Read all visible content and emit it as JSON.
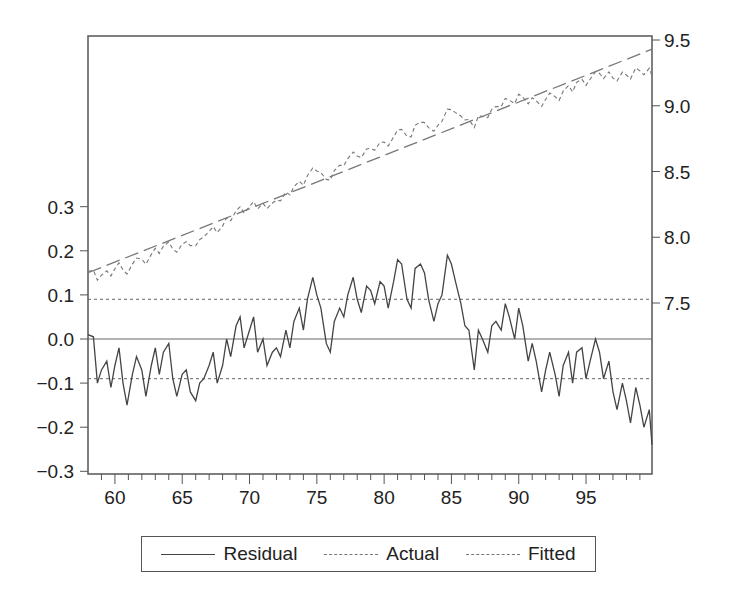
{
  "chart_data": {
    "type": "line",
    "title": "",
    "xlabel": "",
    "ylabel_left": "",
    "ylabel_right": "",
    "x_ticks": [
      "60",
      "65",
      "70",
      "75",
      "80",
      "85",
      "90",
      "95"
    ],
    "x_range": [
      58.0,
      99.9
    ],
    "left_axis": {
      "ticks": [
        "0.3",
        "0.2",
        "0.1",
        "0.0",
        "-0.1",
        "-0.2",
        "-0.3"
      ],
      "range": [
        -0.3,
        0.3
      ],
      "series": [
        "Residual"
      ]
    },
    "right_axis": {
      "ticks": [
        "9.5",
        "9.0",
        "8.5",
        "8.0",
        "7.5"
      ],
      "range": [
        7.5,
        9.5
      ],
      "series": [
        "Actual",
        "Fitted"
      ]
    },
    "reference_lines": {
      "zero": 0.0,
      "upper_band": 0.09,
      "lower_band": -0.09
    },
    "legend": {
      "position": "bottom",
      "entries": [
        "Residual",
        "Actual",
        "Fitted"
      ]
    },
    "fitted_line": {
      "start": [
        58.0,
        7.73
      ],
      "end": [
        99.9,
        9.43
      ]
    },
    "series": [
      {
        "name": "Residual",
        "axis": "left",
        "x": [
          58.0,
          58.4,
          58.7,
          59.0,
          59.4,
          59.7,
          60.0,
          60.3,
          60.6,
          60.9,
          61.3,
          61.6,
          62.0,
          62.3,
          62.7,
          63.0,
          63.3,
          63.6,
          64.0,
          64.3,
          64.6,
          65.0,
          65.3,
          65.6,
          66.0,
          66.3,
          66.6,
          67.0,
          67.3,
          67.6,
          68.0,
          68.3,
          68.6,
          69.0,
          69.3,
          69.6,
          70.0,
          70.3,
          70.6,
          71.0,
          71.3,
          71.7,
          72.0,
          72.3,
          72.7,
          73.0,
          73.3,
          73.7,
          74.0,
          74.3,
          74.7,
          75.0,
          75.3,
          75.7,
          76.0,
          76.3,
          76.7,
          77.0,
          77.3,
          77.7,
          78.0,
          78.3,
          78.7,
          79.0,
          79.3,
          79.7,
          80.0,
          80.3,
          80.7,
          81.0,
          81.3,
          81.7,
          82.0,
          82.3,
          82.7,
          83.0,
          83.3,
          83.7,
          84.0,
          84.3,
          84.7,
          85.0,
          85.3,
          85.7,
          86.0,
          86.3,
          86.7,
          87.0,
          87.3,
          87.7,
          88.0,
          88.3,
          88.7,
          89.0,
          89.3,
          89.7,
          90.0,
          90.3,
          90.7,
          91.0,
          91.3,
          91.7,
          92.0,
          92.3,
          92.7,
          93.0,
          93.3,
          93.7,
          94.0,
          94.3,
          94.7,
          95.0,
          95.3,
          95.7,
          96.0,
          96.3,
          96.7,
          97.0,
          97.3,
          97.7,
          98.0,
          98.3,
          98.7,
          99.0,
          99.3,
          99.7,
          99.9
        ],
        "values": [
          0.01,
          0.005,
          -0.1,
          -0.07,
          -0.05,
          -0.11,
          -0.06,
          -0.02,
          -0.1,
          -0.15,
          -0.08,
          -0.04,
          -0.07,
          -0.13,
          -0.06,
          -0.02,
          -0.08,
          -0.03,
          -0.01,
          -0.09,
          -0.13,
          -0.08,
          -0.07,
          -0.12,
          -0.14,
          -0.1,
          -0.09,
          -0.06,
          -0.03,
          -0.1,
          -0.06,
          0.0,
          -0.04,
          0.03,
          0.05,
          -0.02,
          0.02,
          0.05,
          -0.03,
          0.0,
          -0.06,
          -0.03,
          -0.02,
          -0.04,
          0.02,
          -0.02,
          0.04,
          0.07,
          0.02,
          0.09,
          0.14,
          0.1,
          0.07,
          -0.01,
          -0.03,
          0.04,
          0.07,
          0.05,
          0.1,
          0.14,
          0.09,
          0.06,
          0.12,
          0.11,
          0.08,
          0.13,
          0.12,
          0.07,
          0.13,
          0.18,
          0.17,
          0.09,
          0.07,
          0.16,
          0.17,
          0.15,
          0.09,
          0.04,
          0.08,
          0.1,
          0.19,
          0.17,
          0.13,
          0.08,
          0.03,
          0.02,
          -0.07,
          0.02,
          0.0,
          -0.03,
          0.03,
          0.04,
          0.02,
          0.08,
          0.05,
          0.0,
          0.07,
          0.03,
          -0.05,
          -0.01,
          -0.05,
          -0.12,
          -0.07,
          -0.03,
          -0.08,
          -0.13,
          -0.06,
          -0.03,
          -0.1,
          -0.03,
          -0.02,
          -0.09,
          -0.05,
          0.0,
          -0.03,
          -0.09,
          -0.05,
          -0.12,
          -0.16,
          -0.1,
          -0.14,
          -0.19,
          -0.11,
          -0.15,
          -0.2,
          -0.16,
          -0.24
        ]
      },
      {
        "name": "Actual",
        "axis": "right",
        "note": "Fitted + Residual"
      },
      {
        "name": "Fitted",
        "axis": "right",
        "note": "linear trend 7.73 → 9.43"
      }
    ]
  },
  "legend": {
    "residual_label": "Residual",
    "actual_label": "Actual",
    "fitted_label": "Fitted"
  },
  "colors": {
    "residual": "#444444",
    "actual": "#777777",
    "fitted": "#777777",
    "frame": "#555555",
    "reference": "#666666"
  }
}
